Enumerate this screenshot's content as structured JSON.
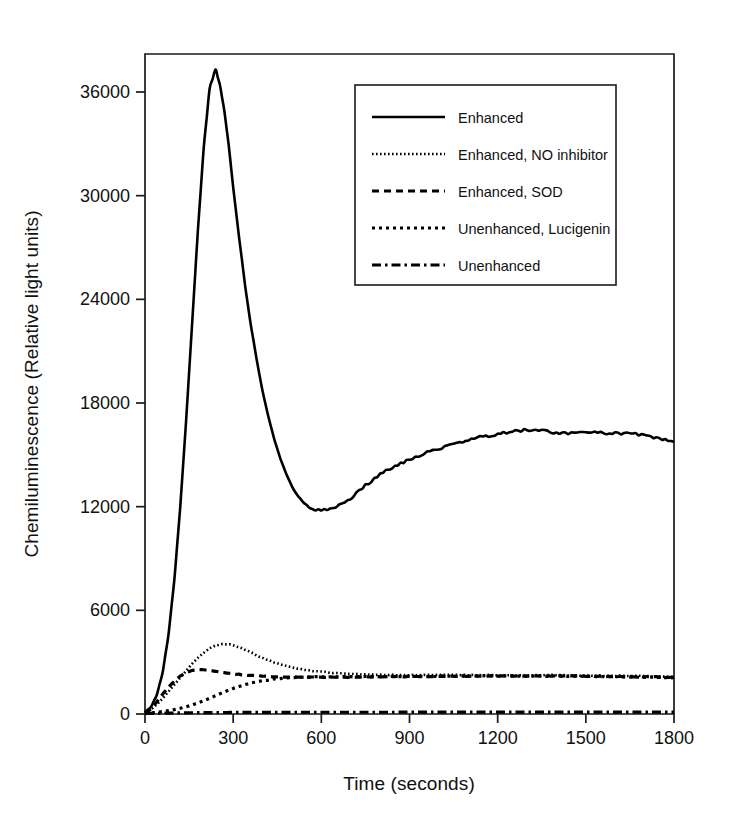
{
  "chart_data": {
    "type": "line",
    "title": "",
    "xlabel": "Time (seconds)",
    "ylabel": "Chemiluminescence (Relative light units)",
    "xlim": [
      0,
      1800
    ],
    "ylim": [
      0,
      38500
    ],
    "xticks": [
      0,
      300,
      600,
      900,
      1200,
      1500,
      1800
    ],
    "xticklabels": [
      "0",
      "300",
      "600",
      "900",
      "1200",
      "1500",
      "1800"
    ],
    "yticks": [
      0,
      6000,
      12000,
      18000,
      24000,
      30000,
      36000
    ],
    "yticklabels": [
      "0",
      "6000",
      "12000",
      "18000",
      "24000",
      "30000",
      "36000"
    ],
    "grid": false,
    "legend_position": "upper-center-right",
    "series": [
      {
        "name": "Enhanced",
        "linestyle": "solid",
        "dasharray": "none",
        "linewidth": 2.6,
        "color": "#000000",
        "x": [
          0,
          20,
          40,
          60,
          80,
          100,
          120,
          140,
          160,
          180,
          200,
          220,
          240,
          255,
          270,
          285,
          300,
          320,
          340,
          360,
          380,
          400,
          420,
          440,
          460,
          480,
          500,
          520,
          540,
          560,
          580,
          600,
          620,
          640,
          660,
          680,
          700,
          720,
          740,
          760,
          780,
          800,
          820,
          840,
          860,
          880,
          900,
          920,
          940,
          960,
          980,
          1000,
          1020,
          1040,
          1060,
          1080,
          1100,
          1120,
          1140,
          1160,
          1180,
          1200,
          1230,
          1260,
          1290,
          1320,
          1350,
          1380,
          1410,
          1440,
          1470,
          1500,
          1530,
          1560,
          1590,
          1620,
          1650,
          1680,
          1710,
          1740,
          1770,
          1800
        ],
        "y": [
          120,
          400,
          1100,
          2400,
          4600,
          7800,
          12000,
          17000,
          22500,
          28000,
          32800,
          36200,
          37300,
          36400,
          34900,
          32900,
          30500,
          27600,
          24900,
          22500,
          20500,
          18700,
          17200,
          15900,
          14800,
          13900,
          13200,
          12600,
          12200,
          11950,
          11830,
          11800,
          11820,
          11900,
          12050,
          12250,
          12500,
          12800,
          13100,
          13350,
          13600,
          13850,
          14050,
          14250,
          14430,
          14600,
          14750,
          14880,
          15000,
          15120,
          15230,
          15340,
          15450,
          15560,
          15680,
          15780,
          15870,
          15950,
          16020,
          16080,
          16130,
          16200,
          16300,
          16380,
          16420,
          16450,
          16400,
          16330,
          16280,
          16260,
          16300,
          16320,
          16300,
          16250,
          16230,
          16260,
          16230,
          16180,
          16100,
          15980,
          15850,
          15750
        ]
      },
      {
        "name": "Enhanced, NO inhibitor",
        "linestyle": "fine-dotted",
        "dasharray": "1.6 2.4",
        "linewidth": 2.6,
        "color": "#000000",
        "x": [
          0,
          20,
          40,
          60,
          80,
          100,
          120,
          140,
          160,
          180,
          200,
          220,
          240,
          260,
          280,
          300,
          320,
          340,
          360,
          380,
          400,
          430,
          460,
          490,
          520,
          560,
          600,
          650,
          700,
          750,
          800,
          850,
          900,
          950,
          1000,
          1050,
          1100,
          1150,
          1200,
          1250,
          1300,
          1350,
          1400,
          1450,
          1500,
          1550,
          1600,
          1650,
          1700,
          1750,
          1800
        ],
        "y": [
          80,
          260,
          550,
          900,
          1300,
          1700,
          2100,
          2500,
          2900,
          3250,
          3550,
          3800,
          3960,
          4030,
          4040,
          3980,
          3870,
          3720,
          3560,
          3400,
          3250,
          3050,
          2880,
          2740,
          2630,
          2520,
          2440,
          2370,
          2320,
          2290,
          2270,
          2260,
          2250,
          2250,
          2250,
          2250,
          2250,
          2250,
          2250,
          2250,
          2250,
          2250,
          2250,
          2240,
          2230,
          2220,
          2210,
          2200,
          2190,
          2170,
          2150
        ]
      },
      {
        "name": "Enhanced,  SOD",
        "linestyle": "dashed",
        "dasharray": "7 5",
        "linewidth": 3.2,
        "color": "#000000",
        "x": [
          0,
          20,
          40,
          60,
          80,
          100,
          120,
          140,
          160,
          180,
          200,
          220,
          240,
          260,
          280,
          300,
          330,
          360,
          400,
          450,
          500,
          560,
          620,
          700,
          780,
          860,
          940,
          1020,
          1100,
          1180,
          1260,
          1340,
          1420,
          1500,
          1580,
          1660,
          1740,
          1800
        ],
        "y": [
          60,
          300,
          700,
          1150,
          1550,
          1900,
          2200,
          2400,
          2520,
          2570,
          2560,
          2520,
          2470,
          2420,
          2370,
          2330,
          2270,
          2230,
          2190,
          2160,
          2140,
          2130,
          2130,
          2140,
          2150,
          2160,
          2170,
          2180,
          2190,
          2200,
          2200,
          2200,
          2200,
          2190,
          2180,
          2170,
          2150,
          2130
        ]
      },
      {
        "name": "Unenhanced, Lucigenin",
        "linestyle": "dotted",
        "dasharray": "3 4",
        "linewidth": 3.2,
        "color": "#000000",
        "x": [
          0,
          30,
          60,
          90,
          120,
          150,
          180,
          210,
          240,
          270,
          300,
          330,
          360,
          400,
          440,
          480,
          520,
          560,
          600,
          660,
          720,
          780,
          840,
          900,
          960,
          1020,
          1080,
          1140,
          1200,
          1260,
          1320,
          1380,
          1440,
          1500,
          1560,
          1620,
          1680,
          1740,
          1800
        ],
        "y": [
          40,
          80,
          140,
          220,
          330,
          470,
          640,
          840,
          1060,
          1280,
          1480,
          1650,
          1790,
          1930,
          2020,
          2080,
          2120,
          2140,
          2150,
          2160,
          2160,
          2170,
          2170,
          2180,
          2180,
          2190,
          2190,
          2200,
          2200,
          2200,
          2200,
          2190,
          2190,
          2180,
          2170,
          2160,
          2140,
          2120,
          2100
        ]
      },
      {
        "name": "Unenhanced",
        "linestyle": "dash-dot",
        "dasharray": "9 4 2.5 4",
        "linewidth": 3.2,
        "color": "#000000",
        "x": [
          0,
          100,
          200,
          300,
          400,
          500,
          600,
          700,
          800,
          900,
          1000,
          1100,
          1200,
          1300,
          1400,
          1500,
          1600,
          1700,
          1800
        ],
        "y": [
          30,
          60,
          80,
          90,
          95,
          100,
          100,
          100,
          100,
          105,
          105,
          105,
          105,
          110,
          110,
          110,
          110,
          110,
          110
        ]
      }
    ]
  },
  "legend": {
    "items": [
      {
        "label": "Enhanced",
        "style": "solid"
      },
      {
        "label": "Enhanced, NO inhibitor",
        "style": "fine-dotted"
      },
      {
        "label": "Enhanced,  SOD",
        "style": "dashed"
      },
      {
        "label": "Unenhanced, Lucigenin",
        "style": "dotted"
      },
      {
        "label": "Unenhanced",
        "style": "dash-dot"
      }
    ]
  },
  "colors": {
    "line": "#000000",
    "axis": "#1a1a1a",
    "background": "#ffffff"
  }
}
